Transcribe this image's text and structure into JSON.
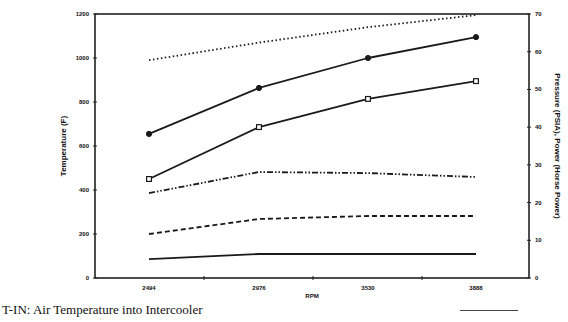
{
  "chart_data": {
    "type": "line",
    "title": "",
    "xlabel": "RPM",
    "ylabel": "Temperature (F)",
    "ylabel_right": "Pressure (PSIA), Power (Horse Power)",
    "categories": [
      "2494",
      "2976",
      "3530",
      "3888"
    ],
    "ylim": [
      0,
      1200
    ],
    "ylim_right": [
      0,
      70
    ],
    "yticks": [
      "0",
      "200",
      "400",
      "600",
      "800",
      "1000",
      "1200"
    ],
    "yticks_right": [
      "0",
      "10",
      "20",
      "30",
      "40",
      "50",
      "60",
      "70"
    ],
    "grid": false,
    "series": [
      {
        "name": "dotted",
        "style": "dotted",
        "marker": "none",
        "values": [
          990,
          1070,
          1140,
          1195
        ]
      },
      {
        "name": "solid-filled-circle",
        "style": "solid",
        "marker": "filled-circle",
        "values": [
          655,
          864,
          1000,
          1095
        ]
      },
      {
        "name": "solid-square",
        "style": "solid",
        "marker": "open-square",
        "values": [
          450,
          686,
          814,
          895
        ]
      },
      {
        "name": "dash-dot",
        "style": "dash-dot-dot",
        "marker": "none",
        "values": [
          386,
          482,
          477,
          459
        ]
      },
      {
        "name": "dashed",
        "style": "dashed",
        "marker": "none",
        "values": [
          200,
          268,
          282,
          282
        ]
      },
      {
        "name": "solid-bottom",
        "style": "solid",
        "marker": "none",
        "values": [
          86,
          109,
          109,
          109
        ]
      }
    ]
  },
  "caption": "T-IN: Air Temperature into Intercooler"
}
